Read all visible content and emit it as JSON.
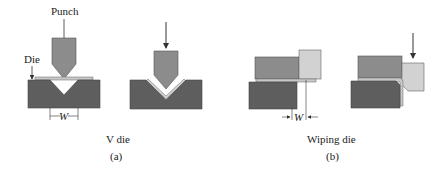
{
  "labels": {
    "punch": "Punch",
    "die": "Die",
    "w_a": "W",
    "w_b": "W",
    "caption_a": "V die",
    "caption_b": "Wiping die",
    "sub_a": "(a)",
    "sub_b": "(b)"
  },
  "colors": {
    "die": "#5e5e5e",
    "punch": "#8c8c8c",
    "sheet": "#c8c8c8",
    "pad": "#d2d2d2",
    "line": "#333333"
  }
}
